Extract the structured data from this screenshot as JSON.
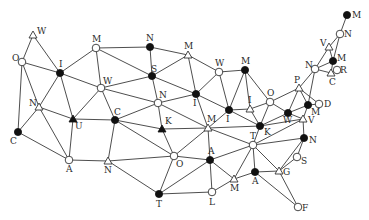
{
  "diagram": {
    "type": "graph",
    "colors": {
      "edge": "#3a3a3a",
      "filled": "#111111",
      "open_fill": "#ffffff",
      "open_stroke": "#333333",
      "label": "#2a2a2a"
    },
    "nodes": [
      {
        "id": "w1",
        "label": "W",
        "x": 33,
        "y": 35,
        "shape": "triangle",
        "fill": "open",
        "lx": 4,
        "ly": -1
      },
      {
        "id": "o1",
        "label": "O",
        "x": 22,
        "y": 62,
        "shape": "circle",
        "fill": "open",
        "lx": -10,
        "ly": -1
      },
      {
        "id": "i1",
        "label": "I",
        "x": 60,
        "y": 73,
        "shape": "circle",
        "fill": "filled",
        "lx": -1,
        "ly": -6
      },
      {
        "id": "n1",
        "label": "N",
        "x": 39,
        "y": 107,
        "shape": "triangle",
        "fill": "open",
        "lx": -10,
        "ly": -1
      },
      {
        "id": "c1",
        "label": "C",
        "x": 18,
        "y": 132,
        "shape": "circle",
        "fill": "filled",
        "lx": -8,
        "ly": 12
      },
      {
        "id": "u1",
        "label": "U",
        "x": 73,
        "y": 119,
        "shape": "triangle",
        "fill": "filled",
        "lx": 2,
        "ly": 10
      },
      {
        "id": "a1",
        "label": "A",
        "x": 69,
        "y": 160,
        "shape": "circle",
        "fill": "open",
        "lx": -3,
        "ly": 12
      },
      {
        "id": "m1",
        "label": "M",
        "x": 96,
        "y": 48,
        "shape": "circle",
        "fill": "open",
        "lx": -4,
        "ly": -6
      },
      {
        "id": "w2",
        "label": "W",
        "x": 101,
        "y": 88,
        "shape": "circle",
        "fill": "open",
        "lx": 2,
        "ly": -4
      },
      {
        "id": "c2",
        "label": "C",
        "x": 115,
        "y": 120,
        "shape": "circle",
        "fill": "filled",
        "lx": -1,
        "ly": -5
      },
      {
        "id": "n2",
        "label": "N",
        "x": 108,
        "y": 161,
        "shape": "triangle",
        "fill": "open",
        "lx": -4,
        "ly": 12
      },
      {
        "id": "n3",
        "label": "N",
        "x": 150,
        "y": 47,
        "shape": "circle",
        "fill": "filled",
        "lx": -4,
        "ly": -6
      },
      {
        "id": "s1",
        "label": "S",
        "x": 152,
        "y": 76,
        "shape": "circle",
        "fill": "filled",
        "lx": -1,
        "ly": -4
      },
      {
        "id": "m2",
        "label": "M",
        "x": 188,
        "y": 55,
        "shape": "triangle",
        "fill": "open",
        "lx": -4,
        "ly": -6
      },
      {
        "id": "n4",
        "label": "N",
        "x": 158,
        "y": 103,
        "shape": "circle",
        "fill": "open",
        "lx": 1,
        "ly": -5
      },
      {
        "id": "i2",
        "label": "I",
        "x": 196,
        "y": 94,
        "shape": "circle",
        "fill": "filled",
        "lx": -3,
        "ly": 12
      },
      {
        "id": "w3",
        "label": "W",
        "x": 219,
        "y": 72,
        "shape": "circle",
        "fill": "open",
        "lx": -4,
        "ly": -6
      },
      {
        "id": "m3",
        "label": "M",
        "x": 245,
        "y": 70,
        "shape": "circle",
        "fill": "filled",
        "lx": -4,
        "ly": -6
      },
      {
        "id": "k1",
        "label": "K",
        "x": 162,
        "y": 129,
        "shape": "triangle",
        "fill": "filled",
        "lx": 3,
        "ly": -5
      },
      {
        "id": "o2",
        "label": "O",
        "x": 174,
        "y": 156,
        "shape": "circle",
        "fill": "open",
        "lx": 2,
        "ly": 11
      },
      {
        "id": "m4",
        "label": "M",
        "x": 208,
        "y": 128,
        "shape": "triangle",
        "fill": "open",
        "lx": -1,
        "ly": -6
      },
      {
        "id": "a2",
        "label": "A",
        "x": 210,
        "y": 160,
        "shape": "circle",
        "fill": "filled",
        "lx": -2,
        "ly": -6
      },
      {
        "id": "t1",
        "label": "T",
        "x": 159,
        "y": 194,
        "shape": "circle",
        "fill": "filled",
        "lx": -3,
        "ly": 13
      },
      {
        "id": "l1",
        "label": "L",
        "x": 212,
        "y": 192,
        "shape": "circle",
        "fill": "open",
        "lx": -3,
        "ly": 13
      },
      {
        "id": "m5",
        "label": "M",
        "x": 234,
        "y": 179,
        "shape": "triangle",
        "fill": "open",
        "lx": -4,
        "ly": 12
      },
      {
        "id": "i3",
        "label": "I",
        "x": 229,
        "y": 110,
        "shape": "circle",
        "fill": "filled",
        "lx": -3,
        "ly": 12
      },
      {
        "id": "i4",
        "label": "I",
        "x": 250,
        "y": 109,
        "shape": "triangle",
        "fill": "open",
        "lx": -2,
        "ly": -6
      },
      {
        "id": "o3",
        "label": "O",
        "x": 270,
        "y": 102,
        "shape": "circle",
        "fill": "open",
        "lx": -3,
        "ly": -6
      },
      {
        "id": "k2",
        "label": "K",
        "x": 260,
        "y": 126,
        "shape": "circle",
        "fill": "filled",
        "lx": 4,
        "ly": 9
      },
      {
        "id": "w4",
        "label": "W",
        "x": 288,
        "y": 113,
        "shape": "circle",
        "fill": "filled",
        "lx": -5,
        "ly": 10
      },
      {
        "id": "p1",
        "label": "P",
        "x": 299,
        "y": 88,
        "shape": "triangle",
        "fill": "open",
        "lx": -5,
        "ly": -5
      },
      {
        "id": "m6",
        "label": "M",
        "x": 308,
        "y": 105,
        "shape": "circle",
        "fill": "filled",
        "lx": 3,
        "ly": 10
      },
      {
        "id": "d1",
        "label": "D",
        "x": 319,
        "y": 104,
        "shape": "circle",
        "fill": "open",
        "lx": 5,
        "ly": 3
      },
      {
        "id": "v1",
        "label": "V",
        "x": 303,
        "y": 119,
        "shape": "triangle",
        "fill": "open",
        "lx": 5,
        "ly": 4
      },
      {
        "id": "n5",
        "label": "N",
        "x": 304,
        "y": 138,
        "shape": "circle",
        "fill": "filled",
        "lx": 5,
        "ly": 5
      },
      {
        "id": "t2",
        "label": "T",
        "x": 253,
        "y": 145,
        "shape": "circle",
        "fill": "open",
        "lx": -3,
        "ly": -6
      },
      {
        "id": "s2",
        "label": "S",
        "x": 297,
        "y": 157,
        "shape": "circle",
        "fill": "open",
        "lx": 4,
        "ly": 7
      },
      {
        "id": "g1",
        "label": "G",
        "x": 279,
        "y": 171,
        "shape": "triangle",
        "fill": "open",
        "lx": 4,
        "ly": 4
      },
      {
        "id": "a3",
        "label": "A",
        "x": 255,
        "y": 172,
        "shape": "circle",
        "fill": "filled",
        "lx": -3,
        "ly": 12
      },
      {
        "id": "f1",
        "label": "F",
        "x": 298,
        "y": 207,
        "shape": "circle",
        "fill": "open",
        "lx": 4,
        "ly": 4
      },
      {
        "id": "n6",
        "label": "N",
        "x": 315,
        "y": 69,
        "shape": "circle",
        "fill": "open",
        "lx": -10,
        "ly": -1
      },
      {
        "id": "m7",
        "label": "M",
        "x": 333,
        "y": 61,
        "shape": "circle",
        "fill": "filled",
        "lx": 4,
        "ly": 0
      },
      {
        "id": "c3",
        "label": "C",
        "x": 331,
        "y": 73,
        "shape": "triangle",
        "fill": "open",
        "lx": -2,
        "ly": 12
      },
      {
        "id": "r1",
        "label": "R",
        "x": 337,
        "y": 70,
        "shape": "circle",
        "fill": "open",
        "lx": 3,
        "ly": 3
      },
      {
        "id": "v2",
        "label": "V",
        "x": 329,
        "y": 47,
        "shape": "triangle",
        "fill": "open",
        "lx": -9,
        "ly": -1
      },
      {
        "id": "n7",
        "label": "N",
        "x": 340,
        "y": 34,
        "shape": "circle",
        "fill": "open",
        "lx": 4,
        "ly": 3
      },
      {
        "id": "m8",
        "label": "M",
        "x": 347,
        "y": 15,
        "shape": "circle",
        "fill": "filled",
        "lx": 5,
        "ly": 3
      }
    ],
    "edges": [
      [
        "w1",
        "o1"
      ],
      [
        "w1",
        "i1"
      ],
      [
        "o1",
        "i1"
      ],
      [
        "o1",
        "n1"
      ],
      [
        "o1",
        "c1"
      ],
      [
        "i1",
        "m1"
      ],
      [
        "i1",
        "w2"
      ],
      [
        "i1",
        "n1"
      ],
      [
        "i1",
        "u1"
      ],
      [
        "n1",
        "c1"
      ],
      [
        "n1",
        "u1"
      ],
      [
        "n1",
        "a1"
      ],
      [
        "c1",
        "a1"
      ],
      [
        "u1",
        "w2"
      ],
      [
        "u1",
        "c2"
      ],
      [
        "u1",
        "a1"
      ],
      [
        "a1",
        "n2"
      ],
      [
        "m1",
        "w2"
      ],
      [
        "m1",
        "n3"
      ],
      [
        "m1",
        "s1"
      ],
      [
        "w2",
        "c2"
      ],
      [
        "w2",
        "s1"
      ],
      [
        "w2",
        "n4"
      ],
      [
        "c2",
        "n2"
      ],
      [
        "c2",
        "k1"
      ],
      [
        "c2",
        "o2"
      ],
      [
        "c2",
        "n4"
      ],
      [
        "n2",
        "o2"
      ],
      [
        "n2",
        "t1"
      ],
      [
        "n3",
        "s1"
      ],
      [
        "n3",
        "m2"
      ],
      [
        "s1",
        "m2"
      ],
      [
        "s1",
        "n4"
      ],
      [
        "s1",
        "i2"
      ],
      [
        "m2",
        "w3"
      ],
      [
        "m2",
        "i2"
      ],
      [
        "n4",
        "i2"
      ],
      [
        "n4",
        "k1"
      ],
      [
        "n4",
        "m4"
      ],
      [
        "k1",
        "o2"
      ],
      [
        "k1",
        "m4"
      ],
      [
        "o2",
        "m4"
      ],
      [
        "o2",
        "a2"
      ],
      [
        "o2",
        "t1"
      ],
      [
        "i2",
        "w3"
      ],
      [
        "i2",
        "m4"
      ],
      [
        "i2",
        "i3"
      ],
      [
        "w3",
        "m3"
      ],
      [
        "w3",
        "i3"
      ],
      [
        "m3",
        "i3"
      ],
      [
        "m3",
        "i4"
      ],
      [
        "m3",
        "o3"
      ],
      [
        "m4",
        "i3"
      ],
      [
        "m4",
        "a2"
      ],
      [
        "m4",
        "k2"
      ],
      [
        "m4",
        "t2"
      ],
      [
        "i3",
        "i4"
      ],
      [
        "i3",
        "k2"
      ],
      [
        "i4",
        "o3"
      ],
      [
        "i4",
        "k2"
      ],
      [
        "o3",
        "k2"
      ],
      [
        "o3",
        "p1"
      ],
      [
        "o3",
        "w4"
      ],
      [
        "k2",
        "w4"
      ],
      [
        "k2",
        "t2"
      ],
      [
        "k2",
        "v1"
      ],
      [
        "w4",
        "p1"
      ],
      [
        "w4",
        "m6"
      ],
      [
        "w4",
        "v1"
      ],
      [
        "p1",
        "n6"
      ],
      [
        "p1",
        "m6"
      ],
      [
        "p1",
        "d1"
      ],
      [
        "m6",
        "d1"
      ],
      [
        "m6",
        "n6"
      ],
      [
        "m6",
        "v1"
      ],
      [
        "n6",
        "v2"
      ],
      [
        "n6",
        "m7"
      ],
      [
        "n6",
        "c3"
      ],
      [
        "v2",
        "n7"
      ],
      [
        "v2",
        "m7"
      ],
      [
        "n7",
        "m8"
      ],
      [
        "n7",
        "m7"
      ],
      [
        "m7",
        "c3"
      ],
      [
        "c3",
        "r1"
      ],
      [
        "v1",
        "n5"
      ],
      [
        "t2",
        "v1"
      ],
      [
        "t2",
        "n5"
      ],
      [
        "t2",
        "a2"
      ],
      [
        "t2",
        "m5"
      ],
      [
        "t2",
        "a3"
      ],
      [
        "t2",
        "g1"
      ],
      [
        "a2",
        "t1"
      ],
      [
        "a2",
        "l1"
      ],
      [
        "a2",
        "m5"
      ],
      [
        "t1",
        "l1"
      ],
      [
        "l1",
        "m5"
      ],
      [
        "m5",
        "a3"
      ],
      [
        "a3",
        "g1"
      ],
      [
        "a3",
        "f1"
      ],
      [
        "g1",
        "n5"
      ],
      [
        "g1",
        "s2"
      ],
      [
        "g1",
        "f1"
      ],
      [
        "s2",
        "n5"
      ]
    ]
  }
}
